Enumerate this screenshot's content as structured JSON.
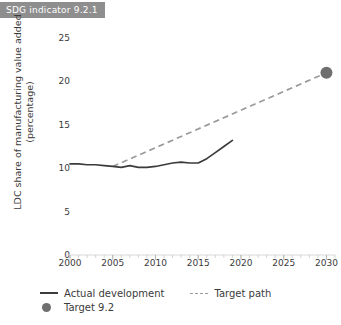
{
  "badge": {
    "label": "SDG indicator 9.2.1"
  },
  "legend": {
    "items": [
      {
        "label": "Actual development",
        "marker": "solid-line-icon",
        "color": "#3b3b3b"
      },
      {
        "label": "Target path",
        "marker": "dashed-line-icon",
        "color": "#9a9a9a"
      },
      {
        "label": "Target 9.2",
        "marker": "filled-circle-icon",
        "color": "#6f6f6f"
      }
    ]
  },
  "chart_data": {
    "type": "line",
    "title": "",
    "xlabel": "",
    "ylabel": "LDC share of manufacturing value added (percentage)",
    "xlim": [
      2000,
      2031
    ],
    "ylim": [
      0,
      25
    ],
    "xticks": [
      2000,
      2005,
      2010,
      2015,
      2020,
      2025,
      2030
    ],
    "yticks": [
      0,
      5,
      10,
      15,
      20,
      25
    ],
    "minor_xtick_step": 1,
    "grid": false,
    "legend_position": "bottom-left",
    "series": [
      {
        "name": "Actual development",
        "style": "solid",
        "color": "#3b3b3b",
        "x": [
          2000,
          2001,
          2002,
          2003,
          2004,
          2005,
          2006,
          2007,
          2008,
          2009,
          2010,
          2011,
          2012,
          2013,
          2014,
          2015,
          2016,
          2017,
          2018,
          2019
        ],
        "values": [
          10.5,
          10.5,
          10.4,
          10.4,
          10.3,
          10.2,
          10.1,
          10.3,
          10.1,
          10.1,
          10.2,
          10.4,
          10.6,
          10.7,
          10.6,
          10.6,
          11.1,
          11.8,
          12.5,
          13.2
        ]
      },
      {
        "name": "Target path",
        "style": "dashed",
        "color": "#9a9a9a",
        "x": [
          2005,
          2030
        ],
        "values": [
          10.2,
          21.0
        ]
      }
    ],
    "points": [
      {
        "name": "Target 9.2",
        "x": 2030,
        "y": 21.0,
        "color": "#6f6f6f",
        "marker": "circle"
      }
    ]
  }
}
